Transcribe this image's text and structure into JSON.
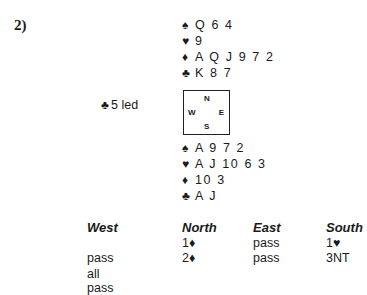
{
  "problem": {
    "number": "2)"
  },
  "north_hand": {
    "spades": {
      "suit": "♠",
      "cards": "Q 6 4"
    },
    "hearts": {
      "suit": "♥",
      "cards": "9"
    },
    "diamonds": {
      "suit": "♦",
      "cards": "A Q J 9 7 2"
    },
    "clubs": {
      "suit": "♣",
      "cards": "K 8 7"
    }
  },
  "south_hand": {
    "spades": {
      "suit": "♠",
      "cards": "A 9 7 2"
    },
    "hearts": {
      "suit": "♥",
      "cards": "A J 10 6 3"
    },
    "diamonds": {
      "suit": "♦",
      "cards": "10 3"
    },
    "clubs": {
      "suit": "♣",
      "cards": "A J"
    }
  },
  "opening_lead": {
    "suit": "♣",
    "text": "5 led"
  },
  "compass": {
    "n": "N",
    "s": "S",
    "w": "W",
    "e": "E"
  },
  "bidding": {
    "headers": [
      "West",
      "North",
      "East",
      "South"
    ],
    "rows": [
      [
        "",
        "1♦",
        "pass",
        "1♥"
      ],
      [
        "pass",
        "2♦",
        "pass",
        "3NT"
      ],
      [
        "all pass",
        "",
        "",
        ""
      ]
    ]
  }
}
